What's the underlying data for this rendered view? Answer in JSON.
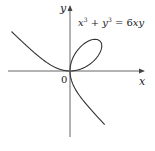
{
  "chart_data": {
    "type": "line",
    "title": "",
    "equation": "x^3 + y^3 = 6xy",
    "xlabel": "x",
    "ylabel": "y",
    "origin_label": "0",
    "grid": false,
    "legend": null,
    "xlim": [
      -6.2,
      7.5
    ],
    "ylim": [
      -6.6,
      6.6
    ],
    "series": [
      {
        "name": "Folium of Descartes",
        "description": "x^3 + y^3 = 6xy; loop in first quadrant with max extent ~(3.17, 3.17), branches asymptotic to x + y = -2",
        "parametric": "x = 6t/(1+t^3), y = 6t^2/(1+t^3)",
        "points_sampled": [
          [
            -5.8,
            3.85
          ],
          [
            -4,
            2.2
          ],
          [
            -2,
            0.8
          ],
          [
            -1,
            0.25
          ],
          [
            0,
            0
          ],
          [
            1.5,
            2.6
          ],
          [
            2.5,
            3.1
          ],
          [
            3.0,
            3.0
          ],
          [
            3.17,
            2.52
          ],
          [
            2.7,
            1.3
          ],
          [
            1.5,
            0.4
          ],
          [
            0,
            0
          ],
          [
            0.2,
            -1.0
          ],
          [
            1.5,
            -3.4
          ],
          [
            3.0,
            -5.2
          ],
          [
            4.3,
            -6.5
          ]
        ]
      }
    ],
    "axes": {
      "x_axis_label": "x",
      "y_axis_label": "y",
      "origin": "0"
    }
  }
}
